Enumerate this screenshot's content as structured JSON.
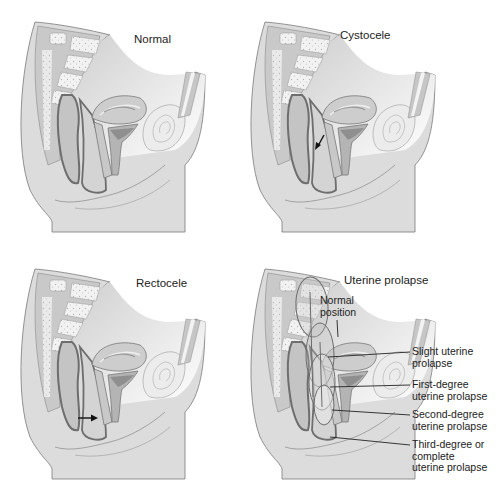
{
  "figure": {
    "panels": [
      {
        "id": "normal",
        "title": "Normal"
      },
      {
        "id": "cystocele",
        "title": "Cystocele",
        "annotation": "arrow-bladder-bulging-into-vagina"
      },
      {
        "id": "rectocele",
        "title": "Rectocele",
        "annotation": "arrow-rectum-bulging-into-vagina"
      },
      {
        "id": "uterine-prolapse",
        "title": "Uterine prolapse",
        "labels": {
          "normal_position": "Normal\nposition",
          "slight": "Slight uterine\nprolapse",
          "first_degree": "First-degree\nuterine prolapse",
          "second_degree": "Second-degree\nuterine prolapse",
          "third_degree": "Third-degree or\ncomplete\nuterine prolapse"
        }
      }
    ],
    "colors": {
      "tissue_light": "#d9d9d9",
      "tissue_mid": "#bdbdbd",
      "tissue_dark": "#8f8f8f",
      "outline": "#6e6e6e",
      "bone": "#efefef",
      "text": "#222222"
    }
  }
}
